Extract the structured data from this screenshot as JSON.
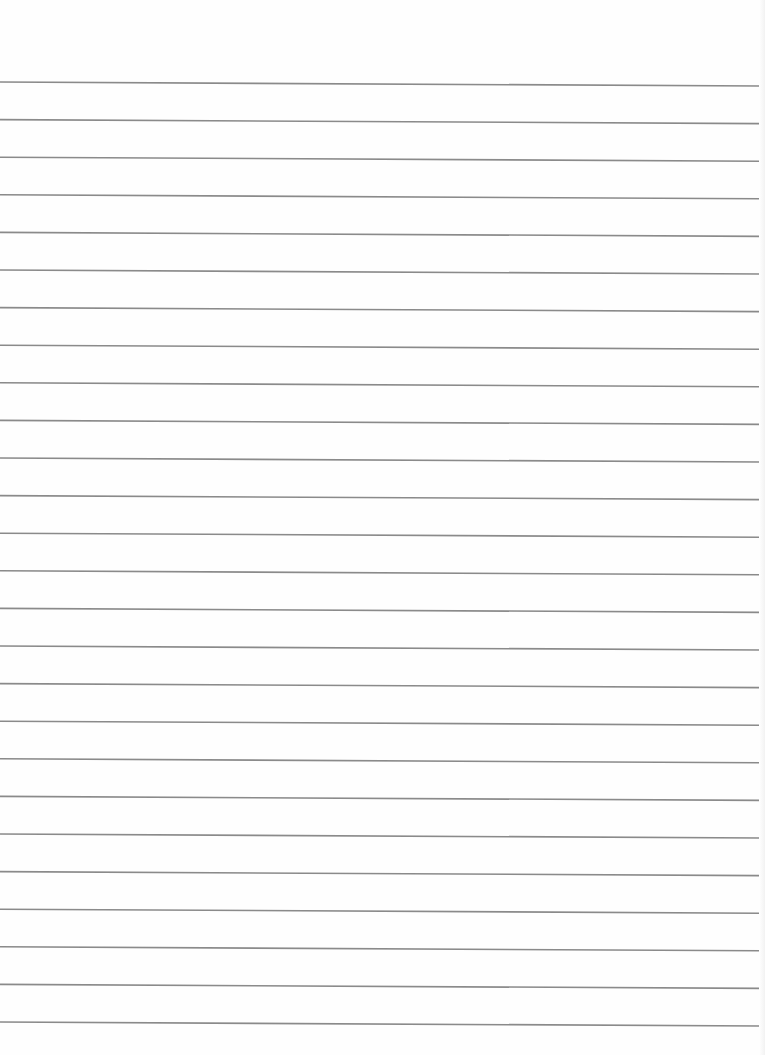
{
  "page": {
    "type": "lined-paper",
    "background_color": "#fefefe",
    "line_color": "#8a8a8a",
    "line_count": 26,
    "first_line_y_left": 82,
    "first_line_y_right": 86,
    "line_spacing": 37.6,
    "line_thickness": 1.6
  }
}
